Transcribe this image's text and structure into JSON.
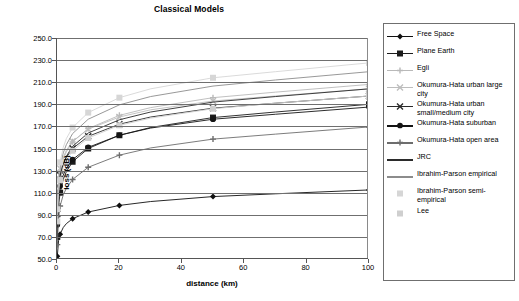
{
  "chart": {
    "title": "Classical Models",
    "xlabel": "distance (km)",
    "ylabel": "loss (dB)"
  },
  "axes": {
    "y_ticks": [
      "250.0",
      "230.0",
      "210.0",
      "190.0",
      "170.0",
      "150.0",
      "130.0",
      "110.0",
      "90.0",
      "70.0",
      "50.0"
    ],
    "x_ticks": [
      "0",
      "20",
      "40",
      "60",
      "80",
      "100"
    ]
  },
  "legend": {
    "items": [
      {
        "label": "Free Space",
        "marker": "diamond",
        "color": "#101010",
        "line": true
      },
      {
        "label": "Plane Earth",
        "marker": "square",
        "color": "#1c1c1c",
        "line": true
      },
      {
        "label": "Egli",
        "marker": "plus",
        "color": "#b9b9b9",
        "line": true
      },
      {
        "label": "Okumura-Hata urban large city",
        "marker": "cross",
        "color": "#bdbdbd",
        "line": true
      },
      {
        "label": "Okumura-Hata urban small/medium city",
        "marker": "cross",
        "color": "#2a2a2a",
        "line": true
      },
      {
        "label": "Okumura-Hata suburban",
        "marker": "circle",
        "color": "#141414",
        "line": true
      },
      {
        "label": "Okumura-Hata open area",
        "marker": "plus",
        "color": "#6d6d6d",
        "line": true
      },
      {
        "label": "JRC",
        "marker": "none",
        "color": "#2b2b2b",
        "line": true
      },
      {
        "label": "Ibrahim-Parson empirical",
        "marker": "none",
        "color": "#8c8c8c",
        "line": true
      },
      {
        "label": "Ibrahim-Parson semi-empirical",
        "marker": "square",
        "color": "#d6d6d6",
        "line": false
      },
      {
        "label": "Lee",
        "marker": "square",
        "color": "#cfcfcf",
        "line": false
      }
    ]
  },
  "chart_data": {
    "type": "line",
    "title": "Classical Models",
    "xlabel": "distance (km)",
    "ylabel": "loss (dB)",
    "xlim": [
      0,
      100
    ],
    "ylim": [
      50,
      250
    ],
    "ytick_step": 20,
    "xtick_step": 20,
    "grid": "horizontal",
    "legend_position": "right",
    "x": [
      0.1,
      0.5,
      1,
      2,
      3,
      5,
      10,
      20,
      30,
      50,
      70,
      100
    ],
    "markers_at_x": [
      0.1,
      1,
      5,
      10,
      20,
      50,
      100
    ],
    "series": [
      {
        "name": "Free Space",
        "marker": "diamond",
        "color": "#101010",
        "values": [
          52.5,
          66.5,
          72.5,
          78.5,
          82.0,
          86.5,
          92.5,
          98.5,
          102.0,
          106.5,
          109.0,
          112.5
        ]
      },
      {
        "name": "Plane Earth",
        "marker": "square",
        "color": "#1c1c1c",
        "values": [
          70.0,
          98.0,
          110.0,
          122.0,
          129.0,
          138.0,
          150.0,
          162.0,
          169.0,
          178.0,
          183.0,
          190.0
        ]
      },
      {
        "name": "Egli",
        "marker": "plus",
        "color": "#b9b9b9",
        "values": [
          88.0,
          116.0,
          128.0,
          140.0,
          147.0,
          156.0,
          168.0,
          180.0,
          187.0,
          196.0,
          201.0,
          208.0
        ]
      },
      {
        "name": "Okumura-Hata urban large city",
        "marker": "cross",
        "color": "#bdbdbd",
        "values": [
          97.0,
          121.0,
          132.0,
          142.0,
          148.5,
          156.5,
          167.5,
          178.5,
          185.0,
          193.0,
          197.5,
          204.0
        ]
      },
      {
        "name": "Okumura-Hata urban small/medium city",
        "marker": "cross",
        "color": "#2a2a2a",
        "values": [
          91.0,
          115.0,
          126.0,
          136.0,
          142.0,
          150.0,
          161.0,
          172.0,
          178.5,
          186.5,
          191.0,
          197.5
        ]
      },
      {
        "name": "Okumura-Hata suburban",
        "marker": "circle",
        "color": "#141414",
        "values": [
          81.0,
          105.0,
          116.0,
          126.0,
          132.0,
          140.0,
          151.0,
          162.0,
          168.5,
          176.5,
          181.0,
          187.5
        ]
      },
      {
        "name": "Okumura-Hata open area",
        "marker": "plus",
        "color": "#6d6d6d",
        "values": [
          63.0,
          87.0,
          98.0,
          108.0,
          114.0,
          122.0,
          133.0,
          144.0,
          150.5,
          158.5,
          163.0,
          169.5
        ]
      },
      {
        "name": "JRC",
        "marker": "none",
        "color": "#2b2b2b",
        "values": [
          86.0,
          112.0,
          124.0,
          136.0,
          143.0,
          152.0,
          164.0,
          176.0,
          183.0,
          192.0,
          197.0,
          204.0
        ]
      },
      {
        "name": "Ibrahim-Parson empirical",
        "marker": "none",
        "color": "#8c8c8c",
        "values": [
          92.0,
          120.0,
          133.0,
          146.0,
          153.5,
          163.5,
          176.5,
          189.5,
          197.0,
          206.5,
          212.0,
          219.5
        ]
      },
      {
        "name": "Ibrahim-Parson semi-empirical",
        "marker": "square",
        "color": "#d6d6d6",
        "values": [
          95.0,
          124.0,
          137.5,
          151.0,
          159.0,
          169.0,
          182.5,
          196.0,
          204.0,
          214.0,
          219.5,
          227.5
        ]
      },
      {
        "name": "Lee",
        "marker": "square",
        "color": "#cfcfcf",
        "values": [
          84.0,
          110.0,
          121.5,
          133.0,
          139.5,
          148.0,
          159.5,
          171.0,
          177.5,
          186.0,
          191.0,
          197.5
        ]
      }
    ]
  }
}
